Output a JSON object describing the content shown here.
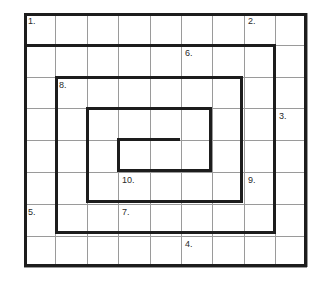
{
  "puzzle": {
    "type": "spiral-grid-crossword",
    "grid": {
      "columns": 9,
      "rows": 8,
      "cell_width": 31.4,
      "cell_height": 31.8,
      "origin_x": 24,
      "origin_y": 13,
      "thin_line_color": "#9a9a9a",
      "thick_line_color": "#1d1d1d",
      "background_color": "#ffffff",
      "thin_line_width": 1,
      "thick_line_width": 3
    },
    "clue_numbers": [
      {
        "label": "1.",
        "col": 1,
        "row": 1
      },
      {
        "label": "2.",
        "col": 8,
        "row": 1
      },
      {
        "label": "6.",
        "col": 6,
        "row": 2
      },
      {
        "label": "8.",
        "col": 2,
        "row": 3
      },
      {
        "label": "3.",
        "col": 9,
        "row": 4
      },
      {
        "label": "10.",
        "col": 4,
        "row": 6
      },
      {
        "label": "9.",
        "col": 8,
        "row": 6
      },
      {
        "label": "5.",
        "col": 1,
        "row": 7
      },
      {
        "label": "7.",
        "col": 4,
        "row": 7
      },
      {
        "label": "4.",
        "col": 6,
        "row": 8
      }
    ],
    "thick_segments": [
      {
        "name": "outer-border-top",
        "orient": "h",
        "x": 0,
        "y": 0,
        "len": 283
      },
      {
        "name": "outer-border-bottom",
        "orient": "h",
        "x": 0,
        "y": 251,
        "len": 283
      },
      {
        "name": "outer-border-left",
        "orient": "v",
        "x": 0,
        "y": 0,
        "len": 254
      },
      {
        "name": "outer-border-right",
        "orient": "v",
        "x": 280,
        "y": 0,
        "len": 254
      },
      {
        "name": "spiral-arm-1-top",
        "orient": "h",
        "x": 0,
        "y": 31,
        "len": 252
      },
      {
        "name": "spiral-arm-1-right",
        "orient": "v",
        "x": 249,
        "y": 31,
        "len": 190
      },
      {
        "name": "spiral-arm-1-bottom",
        "orient": "h",
        "x": 31,
        "y": 218,
        "len": 221
      },
      {
        "name": "spiral-arm-1-left",
        "orient": "v",
        "x": 31,
        "y": 63,
        "len": 158
      },
      {
        "name": "spiral-arm-2-top",
        "orient": "h",
        "x": 31,
        "y": 63,
        "len": 188
      },
      {
        "name": "spiral-arm-2-right",
        "orient": "v",
        "x": 216,
        "y": 63,
        "len": 127
      },
      {
        "name": "spiral-arm-2-bottom",
        "orient": "h",
        "x": 62,
        "y": 187,
        "len": 157
      },
      {
        "name": "spiral-arm-2-left",
        "orient": "v",
        "x": 62,
        "y": 94,
        "len": 96
      },
      {
        "name": "spiral-arm-3-top",
        "orient": "h",
        "x": 62,
        "y": 94,
        "len": 126
      },
      {
        "name": "spiral-arm-3-right",
        "orient": "v",
        "x": 185,
        "y": 94,
        "len": 65
      },
      {
        "name": "spiral-arm-3-bottom",
        "orient": "h",
        "x": 93,
        "y": 156,
        "len": 95
      },
      {
        "name": "spiral-arm-3-left",
        "orient": "v",
        "x": 93,
        "y": 125,
        "len": 34
      },
      {
        "name": "spiral-arm-4-top",
        "orient": "h",
        "x": 93,
        "y": 125,
        "len": 63
      }
    ]
  }
}
